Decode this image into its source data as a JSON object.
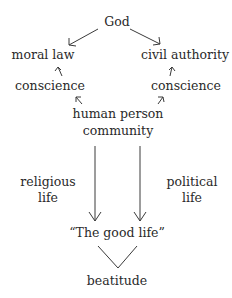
{
  "diagram": {
    "nodes": {
      "god": "God",
      "moral_law": "moral law",
      "civil_authority": "civil authority",
      "conscience_left": "conscience",
      "conscience_right": "conscience",
      "human_person": "human person",
      "community": "community",
      "religious": "religious",
      "religious_life": "life",
      "political": "political",
      "political_life": "life",
      "good_life": "“The good life”",
      "beatitude": "beatitude"
    },
    "edges": [
      {
        "from": "God",
        "to": "moral law"
      },
      {
        "from": "God",
        "to": "civil authority"
      },
      {
        "from": "conscience",
        "to": "moral law"
      },
      {
        "from": "conscience",
        "to": "civil authority"
      },
      {
        "from": "human person",
        "to": "conscience (left)"
      },
      {
        "from": "human person",
        "to": "conscience (right)"
      },
      {
        "from": "community",
        "to": "The good life",
        "label": "religious life"
      },
      {
        "from": "community",
        "to": "The good life",
        "label": "political life"
      },
      {
        "from": "The good life",
        "to": "beatitude"
      }
    ]
  }
}
